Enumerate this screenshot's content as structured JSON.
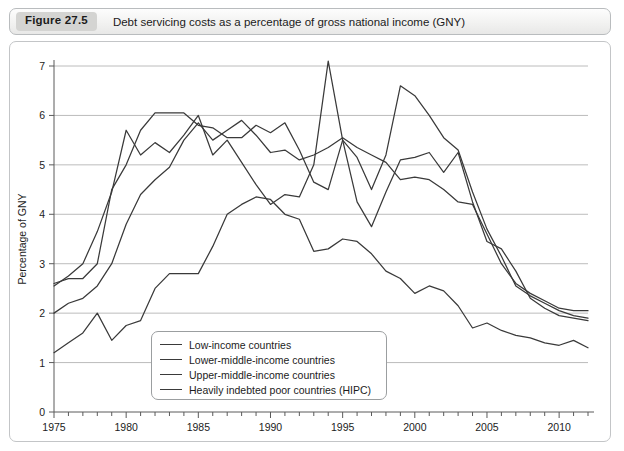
{
  "caption": {
    "figure_number": "Figure 27.5",
    "title": "Debt servicing costs as a percentage of gross national income (GNY)"
  },
  "chart_data": {
    "type": "line",
    "title": "Debt servicing costs as a percentage of gross national income (GNY)",
    "xlabel": "",
    "ylabel": "Percentage of GNY",
    "xlim": [
      1975,
      2012
    ],
    "ylim": [
      0,
      7
    ],
    "grid": true,
    "legend_position": "bottom-left-inside",
    "y_ticks": [
      0,
      1,
      2,
      3,
      4,
      5,
      6,
      7
    ],
    "x_ticks": [
      1975,
      1980,
      1985,
      1990,
      1995,
      2000,
      2005,
      2010
    ],
    "x_tick_labels": [
      "1975",
      "1980",
      "1985",
      "1990",
      "1995",
      "2000",
      "2005",
      "2010"
    ],
    "y_tick_labels": [
      "0",
      "1",
      "2",
      "3",
      "4",
      "5",
      "6",
      "7"
    ],
    "x": [
      1975,
      1976,
      1977,
      1978,
      1979,
      1980,
      1981,
      1982,
      1983,
      1984,
      1985,
      1986,
      1987,
      1988,
      1989,
      1990,
      1991,
      1992,
      1993,
      1994,
      1995,
      1996,
      1997,
      1998,
      1999,
      2000,
      2001,
      2002,
      2003,
      2004,
      2005,
      2006,
      2007,
      2008,
      2009,
      2010,
      2011,
      2012
    ],
    "series": [
      {
        "name": "Low-income countries",
        "color": "#3a3a3a",
        "values": [
          2.6,
          2.7,
          2.7,
          3.0,
          4.5,
          5.0,
          5.7,
          6.05,
          6.05,
          6.05,
          5.8,
          5.75,
          5.55,
          5.55,
          5.8,
          5.65,
          5.85,
          5.3,
          4.65,
          4.5,
          5.5,
          5.15,
          4.5,
          5.2,
          6.6,
          6.4,
          6.0,
          5.55,
          5.3,
          4.45,
          3.7,
          3.15,
          2.55,
          2.35,
          2.2,
          2.05,
          1.95,
          1.9
        ]
      },
      {
        "name": "Lower-middle-income countries",
        "color": "#3a3a3a",
        "values": [
          2.0,
          2.2,
          2.3,
          2.55,
          3.0,
          3.8,
          4.4,
          4.7,
          4.95,
          5.5,
          5.85,
          5.5,
          5.7,
          5.9,
          5.6,
          5.25,
          5.3,
          5.1,
          5.2,
          5.35,
          5.55,
          5.35,
          5.2,
          5.05,
          4.7,
          4.75,
          4.7,
          4.5,
          4.25,
          4.2,
          3.6,
          3.0,
          2.6,
          2.4,
          2.25,
          2.1,
          2.05,
          2.05
        ]
      },
      {
        "name": "Upper-middle-income countries",
        "color": "#3a3a3a",
        "values": [
          2.55,
          2.75,
          3.0,
          3.65,
          4.45,
          5.7,
          5.2,
          5.45,
          5.25,
          5.6,
          6.0,
          5.2,
          5.5,
          5.05,
          4.6,
          4.2,
          4.4,
          4.35,
          5.0,
          7.1,
          5.5,
          4.25,
          3.75,
          4.45,
          5.1,
          5.15,
          5.25,
          4.85,
          5.25,
          4.25,
          3.45,
          3.3,
          2.85,
          2.3,
          2.1,
          1.95,
          1.9,
          1.85
        ]
      },
      {
        "name": "Heavily indebted poor countries (HIPC)",
        "color": "#3a3a3a",
        "values": [
          1.2,
          1.4,
          1.6,
          2.0,
          1.45,
          1.75,
          1.85,
          2.5,
          2.8,
          2.8,
          2.8,
          3.35,
          4.0,
          4.2,
          4.35,
          4.3,
          4.0,
          3.9,
          3.25,
          3.3,
          3.5,
          3.45,
          3.2,
          2.85,
          2.7,
          2.4,
          2.55,
          2.45,
          2.15,
          1.7,
          1.8,
          1.65,
          1.55,
          1.5,
          1.4,
          1.35,
          1.45,
          1.3
        ]
      }
    ]
  },
  "legend": {
    "items": [
      {
        "label": "Low-income countries"
      },
      {
        "label": "Lower-middle-income countries"
      },
      {
        "label": "Upper-middle-income countries"
      },
      {
        "label": "Heavily indebted poor countries (HIPC)"
      }
    ]
  }
}
